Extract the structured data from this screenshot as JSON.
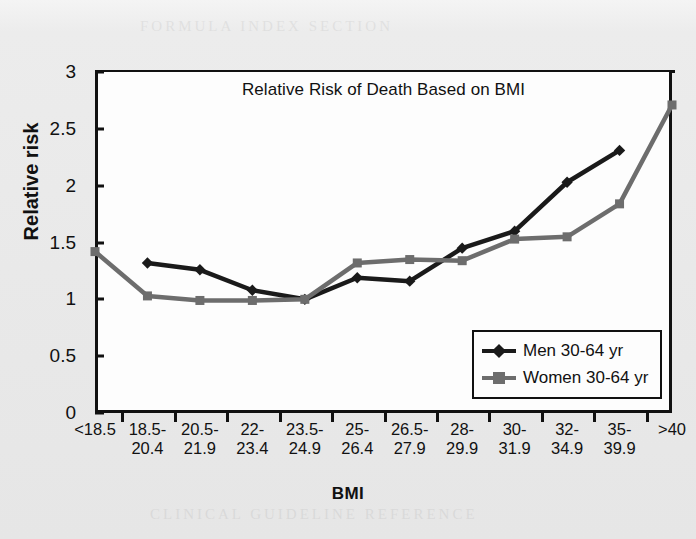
{
  "chart_data": {
    "type": "line",
    "title": "Relative Risk of Death Based on BMI",
    "xlabel": "BMI",
    "ylabel": "Relative risk",
    "categories": [
      "<18.5",
      "18.5-\n20.4",
      "20.5-\n21.9",
      "22-\n23.4",
      "23.5-\n24.9",
      "25-\n26.4",
      "26.5-\n27.9",
      "28-\n29.9",
      "30-\n31.9",
      "32-\n34.9",
      "35-\n39.9",
      ">40"
    ],
    "category_lines": [
      [
        "<18.5",
        ""
      ],
      [
        "18.5-",
        "20.4"
      ],
      [
        "20.5-",
        "21.9"
      ],
      [
        "22-",
        "23.4"
      ],
      [
        "23.5-",
        "24.9"
      ],
      [
        "25-",
        "26.4"
      ],
      [
        "26.5-",
        "27.9"
      ],
      [
        "28-",
        "29.9"
      ],
      [
        "30-",
        "31.9"
      ],
      [
        "32-",
        "34.9"
      ],
      [
        "35-",
        "39.9"
      ],
      [
        ">40",
        ""
      ]
    ],
    "yticks": [
      0,
      0.5,
      1,
      1.5,
      2,
      2.5,
      3
    ],
    "ytick_labels": [
      "0",
      "0.5",
      "1",
      "1.5",
      "2",
      "2.5",
      "3"
    ],
    "ylim": [
      0,
      3
    ],
    "grid": false,
    "legend_position": "bottom-right",
    "series": [
      {
        "name": "Men 30-64 yr",
        "color": "#1a1a1a",
        "marker": "diamond",
        "values": [
          null,
          1.32,
          1.26,
          1.08,
          1.0,
          1.19,
          1.16,
          1.45,
          1.6,
          2.03,
          2.31,
          null
        ]
      },
      {
        "name": "Women 30-64 yr",
        "color": "#6d6d6d",
        "marker": "square",
        "values": [
          1.42,
          1.03,
          0.99,
          0.99,
          1.0,
          1.32,
          1.35,
          1.34,
          1.53,
          1.55,
          1.84,
          2.71
        ]
      }
    ]
  },
  "legend": {
    "entries": [
      {
        "label": "Men 30-64 yr"
      },
      {
        "label": "Women 30-64 yr"
      }
    ]
  },
  "colors": {
    "men": "#1a1a1a",
    "women": "#6d6d6d",
    "axis": "#111111",
    "page_background": "#e9e9e9",
    "plot_background": "#fdfdfd"
  }
}
